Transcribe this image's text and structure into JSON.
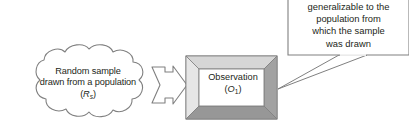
{
  "diagram": {
    "cloud": {
      "name": "random-sample-cloud",
      "line1": "Random sample",
      "line2": "drawn from a population",
      "symbol_open": "(",
      "symbol_letter": "R",
      "symbol_subscript": "s",
      "symbol_close": ")"
    },
    "arrow": {
      "name": "block-arrow",
      "direction": "right"
    },
    "observation_box": {
      "name": "observation-box",
      "line1": "Observation",
      "symbol_open": "(",
      "symbol_letter": "O",
      "symbol_subscript": "1",
      "symbol_close": ")"
    },
    "callout": {
      "name": "generalizability-callout",
      "line1": "generalizable to the",
      "line2": "population from",
      "line3": "which the sample",
      "line4": "was drawn"
    },
    "colors": {
      "stroke": "#808080",
      "text": "#231f20",
      "bevel_top": "#d6d6d6",
      "bevel_left": "#e6e6e6",
      "bevel_right": "#a2a2a2",
      "bevel_bottom": "#979797",
      "box_fill": "#ffffff",
      "background": "#ffffff"
    }
  }
}
